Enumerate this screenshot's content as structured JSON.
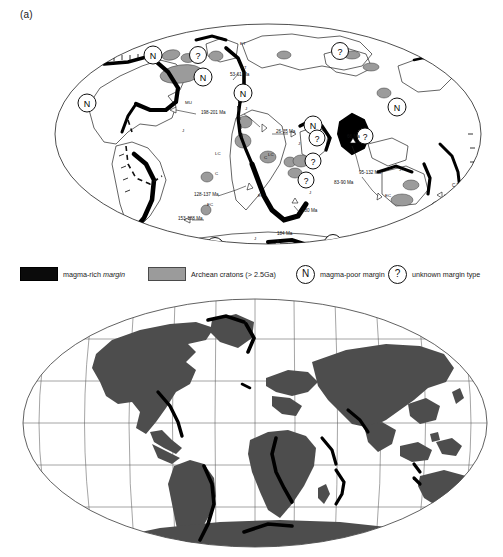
{
  "figure": {
    "panel_label": "(a)",
    "panels": [
      {
        "name": "pangea-reconstruction",
        "projection": "ellipse / Mollweide-like",
        "caption": "(a)"
      },
      {
        "name": "present-day-world",
        "projection": "Robinson with graticule",
        "caption": ""
      }
    ]
  },
  "legend": {
    "items": [
      {
        "key": "magma-rich",
        "symbol": "black-rectangle",
        "color": "#0b0b0b",
        "label_plain": "magma-rich ",
        "label_italic": "margin",
        "label": "magma-rich margin"
      },
      {
        "key": "archean",
        "symbol": "gray-rectangle",
        "color": "#9b9b9b",
        "label": "Archean cratons (> 2.5Ga)"
      },
      {
        "key": "magma-poor",
        "symbol": "circle-N",
        "glyph": "N",
        "label": "magma-poor margin"
      },
      {
        "key": "unknown",
        "symbol": "circle-question",
        "glyph": "?",
        "label": "unknown margin type"
      }
    ]
  },
  "map_top": {
    "age_annotations": [
      {
        "text": "198-201 Ma",
        "x": 201,
        "y": 100
      },
      {
        "text": "53-61 Ma",
        "x": 230,
        "y": 62
      },
      {
        "text": "26-35 Ma",
        "x": 276,
        "y": 119
      },
      {
        "text": "66 Ma",
        "x": 347,
        "y": 124
      },
      {
        "text": "83-90 Ma",
        "x": 334,
        "y": 170
      },
      {
        "text": "95-132 Ma",
        "x": 359,
        "y": 160
      },
      {
        "text": "128-137 Ma",
        "x": 194,
        "y": 182
      },
      {
        "text": "153-188 Ma",
        "x": 178,
        "y": 206
      },
      {
        "text": "180 Ma",
        "x": 302,
        "y": 198
      },
      {
        "text": "184 Ma",
        "x": 277,
        "y": 221
      },
      {
        "text": "C ?100-",
        "x": 452,
        "y": 173
      },
      {
        "text": "-125 Ma",
        "x": 453,
        "y": 180
      }
    ],
    "code_labels": [
      {
        "text": "MU",
        "x": 185,
        "y": 90
      },
      {
        "text": "ET",
        "x": 240,
        "y": 31
      },
      {
        "text": "ET",
        "x": 241,
        "y": 55
      },
      {
        "text": "LC",
        "x": 215,
        "y": 141
      },
      {
        "text": "LC",
        "x": 268,
        "y": 142
      },
      {
        "text": "C",
        "x": 215,
        "y": 161
      },
      {
        "text": "C",
        "x": 264,
        "y": 145
      },
      {
        "text": "C",
        "x": 294,
        "y": 205
      },
      {
        "text": "EC",
        "x": 207,
        "y": 192
      },
      {
        "text": "EC",
        "x": 258,
        "y": 183
      },
      {
        "text": "EC",
        "x": 385,
        "y": 183
      },
      {
        "text": "J",
        "x": 182,
        "y": 118
      },
      {
        "text": "J",
        "x": 245,
        "y": 96
      },
      {
        "text": "J",
        "x": 298,
        "y": 131
      },
      {
        "text": "J",
        "x": 309,
        "y": 180
      },
      {
        "text": "J",
        "x": 254,
        "y": 226
      },
      {
        "text": "J?",
        "x": 399,
        "y": 157
      },
      {
        "text": "ET?",
        "x": 458,
        "y": 196
      }
    ],
    "margin_markers": [
      {
        "type": "N",
        "x": 87,
        "y": 89
      },
      {
        "type": "N",
        "x": 153,
        "y": 41
      },
      {
        "type": "N",
        "x": 203,
        "y": 63
      },
      {
        "type": "N",
        "x": 243,
        "y": 79
      },
      {
        "type": "N",
        "x": 313,
        "y": 111
      },
      {
        "type": "N",
        "x": 397,
        "y": 93
      },
      {
        "type": "?",
        "x": 198,
        "y": 41
      },
      {
        "type": "?",
        "x": 340,
        "y": 37
      },
      {
        "type": "?",
        "x": 317,
        "y": 124
      },
      {
        "type": "?",
        "x": 365,
        "y": 122
      },
      {
        "type": "?",
        "x": 313,
        "y": 147
      },
      {
        "type": "?",
        "x": 306,
        "y": 166
      },
      {
        "type": "?",
        "x": 438,
        "y": 196
      },
      {
        "type": "?",
        "x": 215,
        "y": 240
      },
      {
        "type": "?",
        "x": 333,
        "y": 237
      }
    ]
  },
  "map_bottom": {
    "graticule": {
      "meridian_spacing_deg": 30,
      "parallel_spacing_deg": 30,
      "visible": true
    },
    "land_color": "#4d4d4d",
    "highlight_color": "#000000"
  }
}
